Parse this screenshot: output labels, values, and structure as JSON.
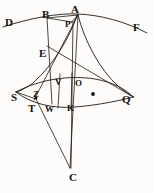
{
  "figure": {
    "width": 154,
    "height": 193,
    "background_color": "#fdfcfa",
    "ink_color": "#15110e",
    "stroke_color": "#201914",
    "labels": [
      {
        "id": "D",
        "text": "D",
        "x": 5,
        "y": 17,
        "size": "normal"
      },
      {
        "id": "B",
        "text": "B",
        "x": 42,
        "y": 10,
        "size": "normal"
      },
      {
        "id": "A",
        "text": "A",
        "x": 71,
        "y": 7,
        "size": "normal"
      },
      {
        "id": "P",
        "text": "P",
        "x": 65,
        "y": 22,
        "size": "small"
      },
      {
        "id": "F",
        "text": "F",
        "x": 133,
        "y": 23,
        "size": "normal"
      },
      {
        "id": "E",
        "text": "E",
        "x": 40,
        "y": 49,
        "size": "normal"
      },
      {
        "id": "V",
        "text": "V",
        "x": 56,
        "y": 79,
        "size": "small"
      },
      {
        "id": "O",
        "text": "O",
        "x": 75,
        "y": 80,
        "size": "small"
      },
      {
        "id": "S",
        "text": "S",
        "x": 11,
        "y": 93,
        "size": "normal"
      },
      {
        "id": "Z",
        "text": "Z",
        "x": 34,
        "y": 93,
        "size": "small"
      },
      {
        "id": "T",
        "text": "T",
        "x": 29,
        "y": 105,
        "size": "normal"
      },
      {
        "id": "W",
        "text": "W",
        "x": 46,
        "y": 106,
        "size": "small"
      },
      {
        "id": "K",
        "text": "K",
        "x": 68,
        "y": 105,
        "size": "small"
      },
      {
        "id": "Q",
        "text": "Q",
        "x": 122,
        "y": 95,
        "size": "normal"
      },
      {
        "id": "C",
        "text": "C",
        "x": 69,
        "y": 174,
        "size": "normal"
      }
    ],
    "markers": [
      {
        "id": "focus-dot",
        "name": "focus-point-marker",
        "x": 93,
        "y": 94,
        "r": 1.9
      }
    ],
    "curves": [
      {
        "id": "arc-DBAF",
        "name": "upper-arc-D-B-A-F",
        "d": "M 3 27 C 30 18, 58 13, 78 14 C 100 15, 124 21, 147 33"
      },
      {
        "id": "arc-SVQ",
        "name": "lens-upper-arc-S-V-O-Q",
        "d": "M 16 92 C 40 79, 70 75, 95 79 C 112 82, 126 89, 133 97"
      },
      {
        "id": "arc-SWKQ",
        "name": "lens-lower-arc-S-W-K-Q",
        "d": "M 16 92 C 30 103, 52 109, 75 107 C 100 105, 122 100, 133 97"
      },
      {
        "id": "curve-A-S",
        "name": "curve-apex-A-to-S",
        "d": "M 77 15 C 70 38, 52 66, 34 82 C 28 87, 21 91, 16 92"
      },
      {
        "id": "curve-A-Q",
        "name": "curve-apex-A-to-Q",
        "d": "M 78 15 C 84 40, 100 70, 118 86 C 125 92, 130 95, 134 97"
      }
    ],
    "lines": [
      {
        "id": "B-A",
        "name": "segment-B-to-A",
        "x1": 47,
        "y1": 18,
        "x2": 78,
        "y2": 15
      },
      {
        "id": "B-P",
        "name": "segment-B-to-P",
        "x1": 47,
        "y1": 18,
        "x2": 72,
        "y2": 22
      },
      {
        "id": "A-P",
        "name": "segment-A-to-P",
        "x1": 78,
        "y1": 15,
        "x2": 71,
        "y2": 23
      },
      {
        "id": "B-W",
        "name": "segment-B-to-W",
        "x1": 47,
        "y1": 18,
        "x2": 52,
        "y2": 104
      },
      {
        "id": "A-T",
        "name": "segment-A-to-T",
        "x1": 78,
        "y1": 15,
        "x2": 34,
        "y2": 100
      },
      {
        "id": "A-C",
        "name": "segment-A-to-C",
        "x1": 78,
        "y1": 15,
        "x2": 70,
        "y2": 168
      },
      {
        "id": "P-C",
        "name": "segment-P-to-C",
        "x1": 73,
        "y1": 21,
        "x2": 71,
        "y2": 168
      },
      {
        "id": "E-Q",
        "name": "segment-E-to-Q",
        "x1": 47,
        "y1": 46,
        "x2": 133,
        "y2": 97
      },
      {
        "id": "S-Z",
        "name": "segment-S-to-Z",
        "x1": 16,
        "y1": 92,
        "x2": 36,
        "y2": 99
      },
      {
        "id": "Z-C",
        "name": "segment-Z-to-C",
        "x1": 36,
        "y1": 99,
        "x2": 70,
        "y2": 168
      },
      {
        "id": "V-K",
        "name": "segment-V-to-K",
        "x1": 60,
        "y1": 74,
        "x2": 58,
        "y2": 108
      },
      {
        "id": "O-K",
        "name": "segment-O-to-K",
        "x1": 72,
        "y1": 73,
        "x2": 71,
        "y2": 109
      }
    ]
  }
}
